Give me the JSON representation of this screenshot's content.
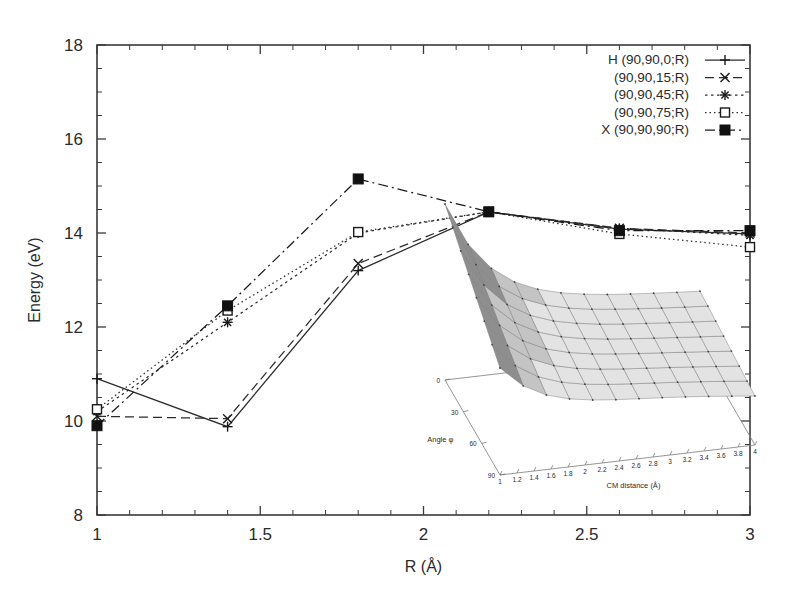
{
  "figure": {
    "title": "",
    "background": "#ffffff",
    "ink_color": "#2b2b2b"
  },
  "chart_data": {
    "type": "line",
    "title": "",
    "xlabel": "R (Å)",
    "ylabel": "Energy (eV)",
    "xlim": [
      1,
      3
    ],
    "ylim": [
      8,
      18
    ],
    "xticks": [
      1,
      1.5,
      2,
      2.5,
      3
    ],
    "xtick_labels": [
      "1",
      "1.5",
      "2",
      "2.5",
      "3"
    ],
    "yticks": [
      8,
      10,
      12,
      14,
      16,
      18
    ],
    "ytick_labels": [
      "8",
      "10",
      "12",
      "14",
      "16",
      "18"
    ],
    "x_minor_step": 0.1,
    "y_minor_step": 0.5,
    "grid": false,
    "legend_position": "top-right",
    "x": [
      1.0,
      1.4,
      1.8,
      2.2,
      2.6,
      3.0
    ],
    "series": [
      {
        "name": "H (90,90,0;R)",
        "marker": "plus",
        "dash": "solid",
        "color": "#2b2b2b",
        "values": [
          10.9,
          9.88,
          13.2,
          14.45,
          14.08,
          13.98
        ]
      },
      {
        "name": "(90,90,15;R)",
        "marker": "cross",
        "dash": "dashed",
        "color": "#2b2b2b",
        "values": [
          10.1,
          10.05,
          13.35,
          14.45,
          14.1,
          14.0
        ]
      },
      {
        "name": "(90,90,45;R)",
        "marker": "star",
        "dash": "dotted",
        "color": "#2b2b2b",
        "values": [
          10.2,
          12.1,
          14.0,
          14.45,
          14.1,
          13.95
        ]
      },
      {
        "name": "(90,90,75;R)",
        "marker": "open-square",
        "dash": "dotted-fine",
        "color": "#2b2b2b",
        "values": [
          10.25,
          12.35,
          14.02,
          14.45,
          13.98,
          13.7
        ]
      },
      {
        "name": "X (90,90,90;R)",
        "marker": "filled-square",
        "dash": "dashdot",
        "color": "#1a1a1a",
        "values": [
          9.9,
          12.45,
          15.15,
          14.45,
          14.05,
          14.05
        ]
      }
    ]
  },
  "legend": {
    "entries": [
      {
        "label": "H (90,90,0;R)"
      },
      {
        "label": "(90,90,15;R)"
      },
      {
        "label": "(90,90,45;R)"
      },
      {
        "label": "(90,90,75;R)"
      },
      {
        "label": "X (90,90,90;R)"
      }
    ]
  },
  "inset": {
    "type": "surface3d",
    "xlabel": "CM distance (Å)",
    "ylabel": "Angle φ",
    "x_tick_labels": [
      "1",
      "1.2",
      "1.4",
      "1.6",
      "1.8",
      "2",
      "2.2",
      "2.4",
      "2.6",
      "2.8",
      "3",
      "3.2",
      "3.4",
      "3.6",
      "3.8",
      "4"
    ],
    "y_tick_labels": [
      "0",
      "30",
      "60",
      "90"
    ],
    "surface_light": "#e3e3e3",
    "surface_mid": "#c4c4c4",
    "surface_dark": "#8e8e8e",
    "surface_darkest": "#6d6d6d"
  }
}
